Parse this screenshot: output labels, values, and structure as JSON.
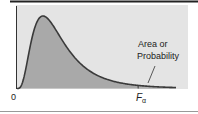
{
  "chart_data": {
    "type": "area",
    "title": "",
    "distribution": "F",
    "annotation": {
      "line1": "Area or",
      "line2": "Probability"
    },
    "x_tick_labels": {
      "origin": "0",
      "critical_value_main": "F",
      "critical_value_sub": "α"
    },
    "shaded_region": "upper tail beyond F_alpha",
    "xlabel": "",
    "ylabel": "",
    "grid": false,
    "colors": {
      "background": "#e4e4e4",
      "area": "#a9a9a9",
      "tail": "#b4b4b4",
      "curve": "#3a3a3a",
      "axis": "#333333"
    }
  }
}
